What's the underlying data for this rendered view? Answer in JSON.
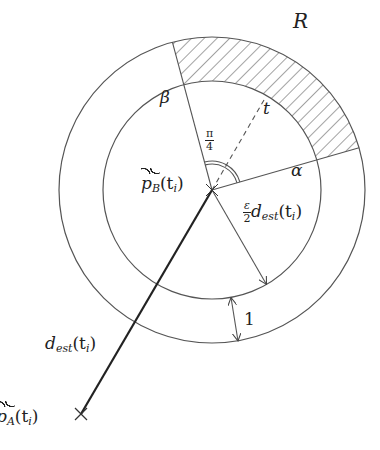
{
  "diagram": {
    "colors": {
      "stroke": "#555555",
      "thick_line": "#222222",
      "hatch": "#555555",
      "text": "#222222",
      "background": "#ffffff"
    },
    "geometry": {
      "center": [
        212,
        190
      ],
      "inner_radius": 109,
      "outer_radius": 153,
      "alpha_angle_deg": 16,
      "beta_angle_deg": 105,
      "t_angle_deg": 60,
      "arc_angle_label": "π/4",
      "pA_point": [
        80,
        415
      ]
    },
    "labels": {
      "region": "R",
      "beta": "β",
      "alpha": "α",
      "t": "t",
      "angle_num": "π",
      "angle_den": "4",
      "pB_main": "p",
      "pB_sub": "B",
      "pB_arg": "(t",
      "pB_arg_sub": "i",
      "pB_close": ")",
      "radius_num": "ε",
      "radius_den": "2",
      "radius_d": "d",
      "radius_sub": "est",
      "radius_arg": "(t",
      "radius_arg_sub": "i",
      "radius_close": ")",
      "unit_gap": "1",
      "dest_d": "d",
      "dest_sub": "est",
      "dest_arg": "(t",
      "dest_arg_sub": "i",
      "dest_close": ")",
      "pA_main": "p",
      "pA_sub": "A",
      "pA_arg": "(t",
      "pA_arg_sub": "i",
      "pA_close": ")"
    }
  }
}
